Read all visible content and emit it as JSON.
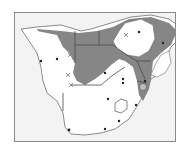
{
  "map": {
    "region": "Southern Africa",
    "colors": {
      "frame_border": "#8a8a8a",
      "ocean": "#f3f3f3",
      "land": "#ffffff",
      "outline": "#6e6e6e",
      "distribution": "#808080",
      "dot": "#222222",
      "cross": "#777777"
    },
    "markers": {
      "dots": [
        {
          "x": 40,
          "y": 60
        },
        {
          "x": 56,
          "y": 58
        },
        {
          "x": 104,
          "y": 72
        },
        {
          "x": 122,
          "y": 78
        },
        {
          "x": 122,
          "y": 82
        },
        {
          "x": 107,
          "y": 98
        },
        {
          "x": 135,
          "y": 104
        },
        {
          "x": 118,
          "y": 120
        },
        {
          "x": 104,
          "y": 128
        },
        {
          "x": 68,
          "y": 129
        },
        {
          "x": 138,
          "y": 31
        },
        {
          "x": 162,
          "y": 42
        },
        {
          "x": 144,
          "y": 80
        }
      ],
      "crosses": [
        {
          "x": 69,
          "y": 54
        },
        {
          "x": 67,
          "y": 74
        },
        {
          "x": 70,
          "y": 84
        },
        {
          "x": 125,
          "y": 34
        }
      ]
    }
  }
}
